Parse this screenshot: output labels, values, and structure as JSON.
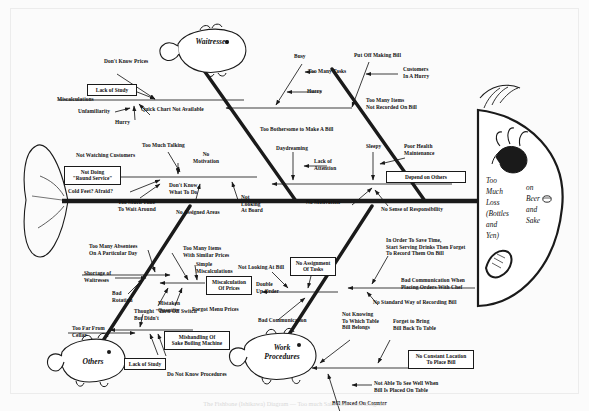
{
  "diagram": {
    "type": "fishbone",
    "title_caption": "The Fishbone (Ishikawa) Diagram — Too much Sake/Beer Loss Diagram",
    "head": {
      "line1": "Too",
      "line2": "Much",
      "line3": "Loss",
      "line4": "(Bottles",
      "line5": "and",
      "line6": "Yen)",
      "right1": "on",
      "right2": "Beer",
      "right3": "and",
      "right4": "Sake"
    },
    "categories": [
      {
        "id": "waitresses",
        "label": "Waitresses",
        "position": "upper-left"
      },
      {
        "id": "customers-bills",
        "label": "",
        "position": "upper-right"
      },
      {
        "id": "others",
        "label": "Others",
        "position": "lower-left"
      },
      {
        "id": "work-procedures",
        "label": "Work\nProcedures",
        "position": "lower-right"
      }
    ],
    "causes": {
      "ul_top": {
        "dont_know_prices": "Don't Know Prices",
        "lack_of_study": "Lack of Study",
        "miscalculations": "Miscalculations",
        "unfamiliarity": "Unfamiliarity",
        "hurry": "Hurry",
        "quick_chart": "Quick Chart Not Available"
      },
      "ul_bottom": {
        "too_much_talking": "Too Much Talking",
        "not_watching_customers": "Not Watching Customers",
        "no_motivation": "No\nMotivation",
        "not_doing_round_service": "Not Doing\n\"Round Service\"",
        "cold_feet": "Cold Feet? Afraid?",
        "dont_know_what_to_do": "Don't Know\nWhat To Do",
        "too_much_time_wait": "Too Much Time\nTo Wait Around",
        "no_assigned_areas": "No Assigned Areas",
        "not_looking_at_board": "Not\nLooking\nAt Board"
      },
      "ur_top": {
        "busy": "Busy",
        "too_many_tasks": "Too Many Tasks",
        "hurry": "Hurry",
        "put_off_making_bill": "Put Off Making Bill",
        "customers_in_a_hurry": "Customers\nIn A Hurry",
        "too_many_items_not_recorded": "Too Many Items\nNot Recorded On Bill",
        "too_bothersome": "Too Bothersome to Make A Bill"
      },
      "ur_bottom": {
        "daydreaming": "Daydreaming",
        "lack_of_attention": "Lack of\nAttention",
        "sleepy": "Sleepy",
        "poor_health": "Poor Health\nMaintenance",
        "depend_on_others": "Depend on Others",
        "no_motivation": "No Motivation",
        "no_sense_of_responsibility": "No Sense of Responsibility"
      },
      "ll_top": {
        "too_many_absentees": "Too Many Absentees\nOn A Particular Day",
        "shortage_of_waitresses": "Shortage of\nWaitresses",
        "bad_rotation": "Bad\nRotation",
        "too_far_from_cellar": "Too Far From\nCellar"
      },
      "ll_mid": {
        "too_many_items_similar": "Too Many Items\nWith Similar Prices",
        "simple_miscalculations": "Simple\nMiscalculations",
        "miscalculation_of_prices": "Miscalculation\nOf Prices",
        "mistaken_quantity": "Mistaken\nQuantity",
        "forgot_menu_prices": "Forgot Menu Prices"
      },
      "ll_bottom": {
        "thought_turn_off_switch": "Thought \"Turn Off Switch\"\nBut Didn't",
        "mishandling_sake_boiling": "Mishandling Of\nSake Boiling Machine",
        "lack_of_study": "Lack of Study",
        "do_not_know_procedures": "Do Not Know Procedures"
      },
      "lr_top": {
        "not_looking_at_bill": "Not Looking At Bill",
        "no_assignment_of_tasks": "No Assignment\nOf Tasks",
        "double_up_order": "Double\nUp Order",
        "bad_communication": "Bad Communication"
      },
      "lr_mid": {
        "in_order_to_save_time": "In Order To Save Time,\nStart Serving Drinks Then Forget\nTo Record Them On Bill",
        "bad_communication_chef": "Bad Communication When\nPlacing Orders With Chef",
        "no_standard_way": "No Standard Way of Recording Bill"
      },
      "lr_bottom": {
        "not_knowing_which_table": "Not Knowing\nTo Which Table\nBill Belongs",
        "forget_to_bring_bill": "Forget to Bring\nBill Back To Table",
        "no_constant_location": "No Constant Location\nTo Place Bill",
        "not_able_to_see_well": "Not Able To See Well When\nBill Is Placed On Table",
        "bill_placed_on_counter": "Bill Placed On Counter"
      }
    },
    "colors": {
      "ink": "#1a1a1a",
      "paper": "#fbfbfb",
      "box_fill": "#ffffff"
    }
  }
}
